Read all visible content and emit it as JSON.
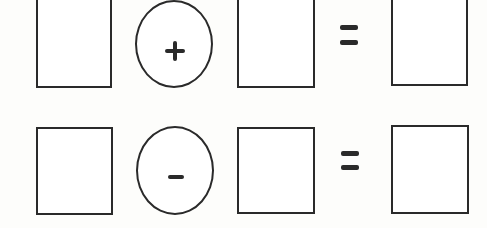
{
  "rows": [
    {
      "operator": "+",
      "equals": "=",
      "operands": [
        "",
        "",
        ""
      ]
    },
    {
      "operator": "-",
      "equals": "=",
      "operands": [
        "",
        "",
        ""
      ]
    }
  ],
  "colors": {
    "stroke": "#2a2a2a",
    "background": "#fdfdfb"
  }
}
